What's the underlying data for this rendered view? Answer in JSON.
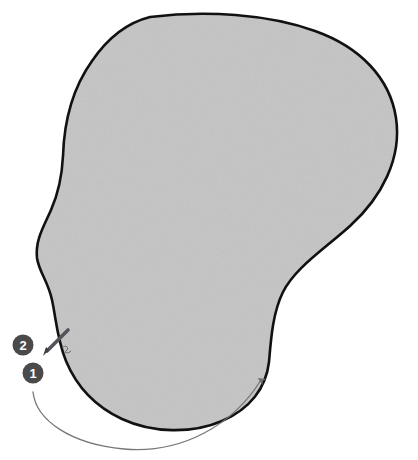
{
  "figure": {
    "background_color": "#ffffff",
    "region": {
      "name": "shaded-anatomical-region",
      "fill_color": "#c4c4c4",
      "outline_color": "#111111",
      "outline_width": 2.6,
      "texture": "fine mottled noise"
    },
    "markers": [
      {
        "id": "marker-2",
        "label": "2",
        "cx": 23,
        "cy": 345,
        "r": 10.5,
        "fill_color": "#4a4a4a",
        "text_color": "#ffffff"
      },
      {
        "id": "marker-1",
        "label": "1",
        "cx": 33,
        "cy": 373,
        "r": 10.5,
        "fill_color": "#4a4a4a",
        "text_color": "#ffffff"
      }
    ],
    "instrument": {
      "name": "needle-probe",
      "color": "#53535a",
      "tip_x": 45,
      "tip_y": 352,
      "tail_x": 70,
      "tail_y": 328,
      "angle_deg": 45
    },
    "direction_arrow": {
      "name": "sweep-direction-arrow",
      "color": "#777777",
      "stroke_width": 1.3,
      "start_x": 33,
      "start_y": 392,
      "end_x": 263,
      "end_y": 375,
      "description": "curved arc sweeping left to right along the inferior border, arrowhead pointing up-right"
    }
  }
}
